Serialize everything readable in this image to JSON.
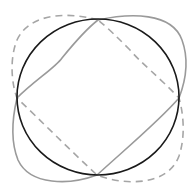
{
  "diagram": {
    "width": 194,
    "height": 192,
    "background": "#ffffff",
    "shapes": [
      {
        "id": "circle",
        "kind": "ellipse",
        "stroke": "#1a1a1a",
        "stroke_width": 1.6,
        "dashed": false,
        "cx": 98,
        "cy": 97,
        "rx": 81,
        "ry": 78
      },
      {
        "id": "solid-gray-curve",
        "kind": "closed-curve",
        "stroke": "#9a9a9a",
        "stroke_width": 1.6,
        "dashed": false,
        "path": "M98,20 C130,13 172,12 182,40 C190,62 184,85 179,98 C160,120 130,145 97,175 C70,185 30,186 18,160 C10,140 13,115 17,98 C35,80 55,68 62,58 C75,42 85,30 98,20 Z"
      },
      {
        "id": "dashed-gray-curve",
        "kind": "closed-curve",
        "stroke": "#a6a6a6",
        "stroke_width": 1.6,
        "dashed": true,
        "dasharray": "7,5",
        "path": "M98,20 C70,12 30,12 17,40 C9,60 12,85 17,98 C40,120 70,150 97,175 C125,186 168,186 179,156 C186,135 183,112 179,98 C160,78 140,62 130,50 C118,38 108,28 98,20 Z"
      }
    ],
    "intersections": [
      {
        "label": "top",
        "x": 98,
        "y": 20
      },
      {
        "label": "left",
        "x": 17,
        "y": 98
      },
      {
        "label": "right",
        "x": 179,
        "y": 98
      },
      {
        "label": "bottom",
        "x": 97,
        "y": 175
      }
    ]
  }
}
